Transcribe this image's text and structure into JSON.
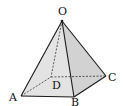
{
  "figure": {
    "type": "square-pyramid",
    "colors": {
      "edge": "#1a1a1a",
      "face_left": "#dcdcdc",
      "face_front": "#e6e6e6",
      "face_right": "#cfcfcf",
      "background": "#ffffff"
    },
    "vertices": {
      "O": {
        "label": "O",
        "x": 62,
        "y": 21
      },
      "A": {
        "label": "A",
        "x": 21,
        "y": 96
      },
      "B": {
        "label": "B",
        "x": 74,
        "y": 97
      },
      "C": {
        "label": "C",
        "x": 106,
        "y": 76
      },
      "D": {
        "label": "D",
        "x": 51,
        "y": 77
      }
    },
    "visible_edges": [
      "OA",
      "OB",
      "OC",
      "AB",
      "BC"
    ],
    "hidden_edges": [
      "OD",
      "AD",
      "DC"
    ]
  }
}
